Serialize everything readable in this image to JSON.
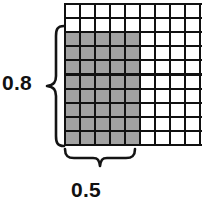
{
  "figure": {
    "type": "area-model",
    "background_color": "#ffffff"
  },
  "grid": {
    "columns": 10,
    "rows": 10,
    "line_color": "#111111",
    "cell_fill_empty": "#ffffff",
    "cell_fill_shaded": "#a2a2a2",
    "shaded_columns": 5,
    "shaded_rows": 8,
    "shaded_anchor": "bottom-left",
    "shaded_cell_count": 40
  },
  "dimensions": {
    "height": {
      "label": "0.8",
      "brace_name": "vertical-brace",
      "position": "left",
      "spans_rows": 8
    },
    "width": {
      "label": "0.5",
      "brace_name": "horizontal-brace",
      "position": "bottom",
      "spans_columns": 5
    }
  },
  "chart_data": {
    "type": "area-model",
    "title": "",
    "grid_columns": 10,
    "grid_rows": 10,
    "shaded_width_units": 5,
    "shaded_height_units": 8,
    "factor_width": 0.5,
    "factor_height": 0.8,
    "shaded_cells": 40,
    "total_cells": 100,
    "labels": [
      "0.8",
      "0.5"
    ]
  }
}
